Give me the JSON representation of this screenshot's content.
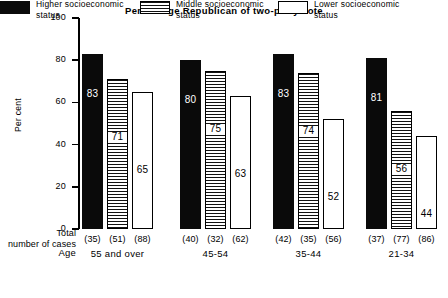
{
  "chart_data": {
    "type": "bar",
    "title": "Percentage Republican of two-party vote",
    "xlabel": "Age",
    "ylabel": "Per cent",
    "ylim": [
      0,
      100
    ],
    "yticks": [
      0,
      20,
      40,
      60,
      80,
      100
    ],
    "grid": false,
    "legend_position": "bottom",
    "categories": [
      "55 and over",
      "45-54",
      "35-44",
      "21-34"
    ],
    "series": [
      {
        "name": "Higher socioeconomic status",
        "key": "higher",
        "values": [
          83,
          80,
          83,
          81
        ],
        "n": [
          "(35)",
          "(40)",
          "(42)",
          "(37)"
        ]
      },
      {
        "name": "Middle socioeconomic status",
        "key": "middle",
        "values": [
          71,
          75,
          74,
          56
        ],
        "n": [
          "(51)",
          "(32)",
          "(35)",
          "(77)"
        ]
      },
      {
        "name": "Lower socioeconomic status",
        "key": "lower",
        "values": [
          65,
          63,
          52,
          44
        ],
        "n": [
          "(88)",
          "(62)",
          "(56)",
          "(86)"
        ]
      }
    ],
    "n_row_label": "Total number of cases",
    "n_row_label_line1": "Total",
    "n_row_label_line2": "number of cases"
  },
  "axis": {
    "y_title": "Per cent",
    "x_title": "Age",
    "tick_labels": [
      "100",
      "80",
      "60",
      "40",
      "20",
      "0"
    ]
  },
  "legend": {
    "items": [
      {
        "swatch": "higher",
        "line1": "Higher socioeconomic",
        "line2": "status"
      },
      {
        "swatch": "middle",
        "line1": "Middle socioeconomic",
        "line2": "status"
      },
      {
        "swatch": "lower",
        "line1": "Lower socioeconomic",
        "line2": "status"
      }
    ]
  },
  "colors": {
    "higher": "#0a0a0a",
    "middle": "#ffffff",
    "lower": "#ffffff",
    "axis": "#000000",
    "background": "#ffffff"
  }
}
